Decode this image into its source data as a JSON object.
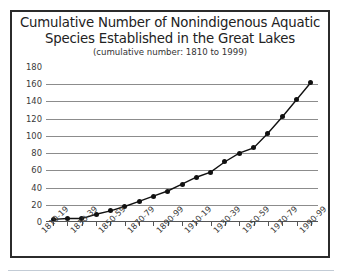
{
  "chart_data": {
    "type": "line",
    "title": "Cumulative Number of Nonindigenous Aquatic\nSpecies Established in the Great Lakes",
    "subtitle": "(cumulative number: 1810 to 1999)",
    "xlabel": "",
    "ylabel": "",
    "ylim": [
      0,
      180
    ],
    "ytick_labels": [
      "180",
      "160",
      "140",
      "120",
      "100",
      "80",
      "60",
      "40",
      "20",
      "0"
    ],
    "ytick_values": [
      180,
      160,
      140,
      120,
      100,
      80,
      60,
      40,
      20,
      0
    ],
    "gridlines": [
      160,
      140,
      120,
      100,
      80,
      60,
      40,
      20
    ],
    "grid": true,
    "legend": "none",
    "marker": "filled-circle",
    "line_color": "#111111",
    "marker_color": "#111111",
    "grid_color": "#8c8c8c",
    "categories": [
      "1810-19",
      "1820-29",
      "1830-39",
      "1840-49",
      "1850-59",
      "1860-69",
      "1870-79",
      "1880-89",
      "1890-99",
      "1900-09",
      "1910-19",
      "1920-29",
      "1930-39",
      "1940-49",
      "1950-59",
      "1960-69",
      "1970-79",
      "1980-89",
      "1990-99"
    ],
    "visible_tick_labels": [
      "1810-19",
      "1830-39",
      "1850-59",
      "1870-79",
      "1890-99",
      "1910-19",
      "1930-39",
      "1950-59",
      "1970-79",
      "1990-99"
    ],
    "values": [
      3,
      4,
      4,
      9,
      13,
      18,
      24,
      30,
      36,
      44,
      52,
      58,
      70,
      80,
      86,
      103,
      122,
      142,
      162
    ],
    "series": [
      {
        "name": "Cumulative species established",
        "values": [
          3,
          4,
          4,
          9,
          13,
          18,
          24,
          30,
          36,
          44,
          52,
          58,
          70,
          80,
          86,
          103,
          122,
          142,
          162
        ]
      }
    ]
  }
}
